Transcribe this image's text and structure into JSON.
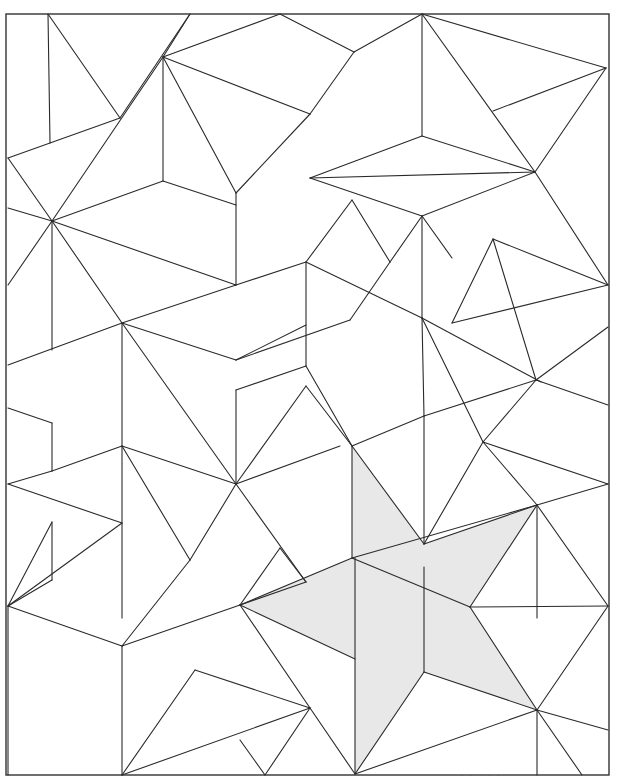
{
  "figure": {
    "type": "geometric-tiling",
    "frame": {
      "x1": 6,
      "y1": 14,
      "x2": 609,
      "y2": 775
    },
    "colors": {
      "line": "#2a2a2a",
      "shade": "#e8e8e8",
      "background": "#ffffff"
    },
    "shaded_region": {
      "label": "star-shaped highlighted tile",
      "points": [
        [
          352,
          446
        ],
        [
          424,
          544
        ],
        [
          537,
          505
        ],
        [
          470,
          607
        ],
        [
          537,
          710
        ],
        [
          424,
          672
        ],
        [
          355,
          774
        ],
        [
          355,
          659
        ],
        [
          240,
          605
        ],
        [
          352,
          558
        ]
      ]
    },
    "segments": [
      [
        [
          48,
          14
        ],
        [
          50,
          143
        ]
      ],
      [
        [
          48,
          14
        ],
        [
          120,
          118
        ]
      ],
      [
        [
          120,
          118
        ],
        [
          8,
          158
        ]
      ],
      [
        [
          120,
          118
        ],
        [
          190,
          14
        ]
      ],
      [
        [
          163,
          57
        ],
        [
          190,
          14
        ]
      ],
      [
        [
          163,
          57
        ],
        [
          280,
          14
        ]
      ],
      [
        [
          163,
          57
        ],
        [
          310,
          114
        ]
      ],
      [
        [
          163,
          57
        ],
        [
          163,
          181
        ]
      ],
      [
        [
          163,
          57
        ],
        [
          236,
          193
        ]
      ],
      [
        [
          236,
          193
        ],
        [
          236,
          285
        ]
      ],
      [
        [
          236,
          193
        ],
        [
          310,
          114
        ]
      ],
      [
        [
          310,
          114
        ],
        [
          354,
          52
        ]
      ],
      [
        [
          280,
          14
        ],
        [
          354,
          52
        ]
      ],
      [
        [
          354,
          52
        ],
        [
          422,
          14
        ]
      ],
      [
        [
          422,
          14
        ],
        [
          422,
          136
        ]
      ],
      [
        [
          422,
          136
        ],
        [
          310,
          178
        ]
      ],
      [
        [
          422,
          136
        ],
        [
          535,
          172
        ]
      ],
      [
        [
          422,
          14
        ],
        [
          535,
          172
        ]
      ],
      [
        [
          422,
          14
        ],
        [
          606,
          68
        ]
      ],
      [
        [
          606,
          68
        ],
        [
          493,
          111
        ]
      ],
      [
        [
          606,
          68
        ],
        [
          535,
          172
        ]
      ],
      [
        [
          535,
          172
        ],
        [
          310,
          178
        ]
      ],
      [
        [
          310,
          178
        ],
        [
          422,
          216
        ]
      ],
      [
        [
          422,
          216
        ],
        [
          535,
          172
        ]
      ],
      [
        [
          535,
          172
        ],
        [
          608,
          285
        ]
      ],
      [
        [
          422,
          216
        ],
        [
          422,
          318
        ]
      ],
      [
        [
          422,
          216
        ],
        [
          390,
          262
        ]
      ],
      [
        [
          422,
          216
        ],
        [
          452,
          258
        ]
      ],
      [
        [
          8,
          158
        ],
        [
          52,
          221
        ]
      ],
      [
        [
          52,
          221
        ],
        [
          163,
          57
        ]
      ],
      [
        [
          8,
          208
        ],
        [
          52,
          221
        ]
      ],
      [
        [
          52,
          221
        ],
        [
          163,
          181
        ]
      ],
      [
        [
          163,
          181
        ],
        [
          236,
          205
        ]
      ],
      [
        [
          52,
          221
        ],
        [
          236,
          285
        ]
      ],
      [
        [
          52,
          221
        ],
        [
          52,
          350
        ]
      ],
      [
        [
          52,
          221
        ],
        [
          8,
          285
        ]
      ],
      [
        [
          52,
          221
        ],
        [
          122,
          323
        ]
      ],
      [
        [
          122,
          323
        ],
        [
          236,
          285
        ]
      ],
      [
        [
          122,
          323
        ],
        [
          8,
          365
        ]
      ],
      [
        [
          122,
          323
        ],
        [
          122,
          618
        ]
      ],
      [
        [
          122,
          323
        ],
        [
          236,
          484
        ]
      ],
      [
        [
          122,
          323
        ],
        [
          236,
          360
        ]
      ],
      [
        [
          236,
          285
        ],
        [
          306,
          262
        ]
      ],
      [
        [
          306,
          262
        ],
        [
          306,
          366
        ]
      ],
      [
        [
          306,
          366
        ],
        [
          236,
          390
        ]
      ],
      [
        [
          306,
          262
        ],
        [
          352,
          200
        ]
      ],
      [
        [
          306,
          262
        ],
        [
          422,
          318
        ]
      ],
      [
        [
          236,
          360
        ],
        [
          306,
          325
        ]
      ],
      [
        [
          352,
          200
        ],
        [
          390,
          262
        ]
      ],
      [
        [
          390,
          262
        ],
        [
          350,
          320
        ]
      ],
      [
        [
          350,
          320
        ],
        [
          236,
          360
        ]
      ],
      [
        [
          306,
          366
        ],
        [
          352,
          446
        ]
      ],
      [
        [
          352,
          446
        ],
        [
          424,
          416
        ]
      ],
      [
        [
          424,
          416
        ],
        [
          536,
          380
        ]
      ],
      [
        [
          424,
          416
        ],
        [
          422,
          318
        ]
      ],
      [
        [
          422,
          318
        ],
        [
          541,
          382
        ]
      ],
      [
        [
          536,
          380
        ],
        [
          608,
          327
        ]
      ],
      [
        [
          536,
          380
        ],
        [
          608,
          405
        ]
      ],
      [
        [
          536,
          380
        ],
        [
          483,
          442
        ]
      ],
      [
        [
          483,
          442
        ],
        [
          422,
          318
        ]
      ],
      [
        [
          493,
          239
        ],
        [
          536,
          380
        ]
      ],
      [
        [
          493,
          239
        ],
        [
          608,
          285
        ]
      ],
      [
        [
          493,
          239
        ],
        [
          452,
          323
        ]
      ],
      [
        [
          452,
          323
        ],
        [
          608,
          285
        ]
      ],
      [
        [
          8,
          408
        ],
        [
          52,
          423
        ]
      ],
      [
        [
          52,
          423
        ],
        [
          52,
          471
        ]
      ],
      [
        [
          8,
          484
        ],
        [
          52,
          471
        ]
      ],
      [
        [
          52,
          471
        ],
        [
          122,
          446
        ]
      ],
      [
        [
          8,
          484
        ],
        [
          122,
          523
        ]
      ],
      [
        [
          122,
          446
        ],
        [
          236,
          484
        ]
      ],
      [
        [
          122,
          446
        ],
        [
          190,
          560
        ]
      ],
      [
        [
          236,
          484
        ],
        [
          306,
          386
        ]
      ],
      [
        [
          306,
          386
        ],
        [
          352,
          446
        ]
      ],
      [
        [
          236,
          484
        ],
        [
          340,
          446
        ]
      ],
      [
        [
          236,
          390
        ],
        [
          236,
          484
        ]
      ],
      [
        [
          236,
          484
        ],
        [
          190,
          560
        ]
      ],
      [
        [
          236,
          484
        ],
        [
          306,
          582
        ]
      ],
      [
        [
          122,
          523
        ],
        [
          8,
          606
        ]
      ],
      [
        [
          8,
          606
        ],
        [
          52,
          522
        ]
      ],
      [
        [
          8,
          606
        ],
        [
          52,
          580
        ]
      ],
      [
        [
          8,
          606
        ],
        [
          122,
          646
        ]
      ],
      [
        [
          52,
          522
        ],
        [
          52,
          580
        ]
      ],
      [
        [
          8,
          606
        ],
        [
          8,
          775
        ]
      ],
      [
        [
          122,
          646
        ],
        [
          190,
          560
        ]
      ],
      [
        [
          122,
          646
        ],
        [
          240,
          605
        ]
      ],
      [
        [
          122,
          646
        ],
        [
          122,
          775
        ]
      ],
      [
        [
          240,
          605
        ],
        [
          280,
          548
        ]
      ],
      [
        [
          280,
          548
        ],
        [
          306,
          582
        ]
      ],
      [
        [
          240,
          605
        ],
        [
          306,
          582
        ]
      ],
      [
        [
          240,
          605
        ],
        [
          310,
          708
        ]
      ],
      [
        [
          122,
          775
        ],
        [
          310,
          708
        ]
      ],
      [
        [
          310,
          708
        ],
        [
          355,
          774
        ]
      ],
      [
        [
          122,
          775
        ],
        [
          195,
          670
        ]
      ],
      [
        [
          195,
          670
        ],
        [
          310,
          708
        ]
      ],
      [
        [
          240,
          740
        ],
        [
          265,
          775
        ]
      ],
      [
        [
          265,
          775
        ],
        [
          310,
          708
        ]
      ],
      [
        [
          424,
          416
        ],
        [
          424,
          544
        ]
      ],
      [
        [
          483,
          442
        ],
        [
          537,
          505
        ]
      ],
      [
        [
          483,
          442
        ],
        [
          424,
          544
        ]
      ],
      [
        [
          537,
          505
        ],
        [
          608,
          484
        ]
      ],
      [
        [
          537,
          505
        ],
        [
          537,
          618
        ]
      ],
      [
        [
          537,
          505
        ],
        [
          608,
          606
        ]
      ],
      [
        [
          608,
          606
        ],
        [
          470,
          607
        ]
      ],
      [
        [
          608,
          606
        ],
        [
          537,
          710
        ]
      ],
      [
        [
          537,
          710
        ],
        [
          608,
          730
        ]
      ],
      [
        [
          537,
          710
        ],
        [
          537,
          775
        ]
      ],
      [
        [
          537,
          710
        ],
        [
          582,
          775
        ]
      ],
      [
        [
          537,
          710
        ],
        [
          355,
          774
        ]
      ],
      [
        [
          483,
          442
        ],
        [
          608,
          484
        ]
      ]
    ],
    "shaded_edges": [
      [
        [
          352,
          446
        ],
        [
          352,
          558
        ]
      ],
      [
        [
          352,
          446
        ],
        [
          424,
          544
        ]
      ],
      [
        [
          424,
          544
        ],
        [
          537,
          505
        ]
      ],
      [
        [
          537,
          505
        ],
        [
          470,
          607
        ]
      ],
      [
        [
          470,
          607
        ],
        [
          537,
          710
        ]
      ],
      [
        [
          537,
          710
        ],
        [
          424,
          672
        ]
      ],
      [
        [
          424,
          672
        ],
        [
          355,
          774
        ]
      ],
      [
        [
          355,
          558
        ],
        [
          355,
          774
        ]
      ],
      [
        [
          352,
          558
        ],
        [
          537,
          505
        ]
      ],
      [
        [
          352,
          558
        ],
        [
          470,
          607
        ]
      ],
      [
        [
          240,
          605
        ],
        [
          352,
          558
        ]
      ],
      [
        [
          240,
          605
        ],
        [
          355,
          659
        ]
      ],
      [
        [
          424,
          567
        ],
        [
          424,
          672
        ]
      ]
    ]
  },
  "caption": {
    "text": "· · ·  ·  ·"
  }
}
